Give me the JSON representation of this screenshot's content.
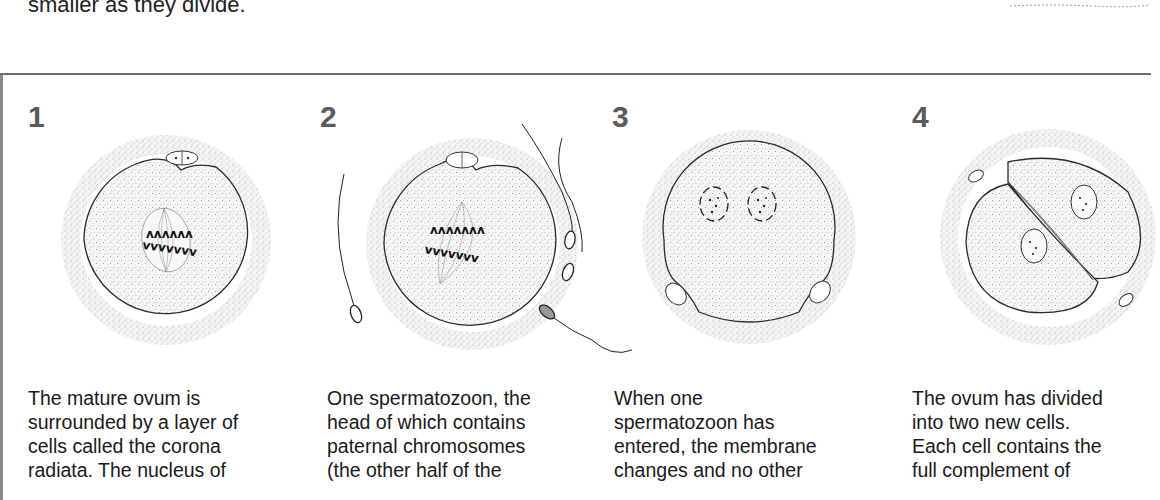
{
  "page": {
    "top_caption": "smaller as they divide.",
    "divider": true
  },
  "panels": [
    {
      "number": "1",
      "illustration": "mature-ovum-with-corona-radiata-and-spindle",
      "caption_lines": [
        "The mature ovum is",
        "surrounded by a layer of",
        "cells called the corona",
        "radiata. The nucleus of"
      ]
    },
    {
      "number": "2",
      "illustration": "spermatozoa-approaching-ovum",
      "caption_lines": [
        "One spermatozoon, the",
        "head of which contains",
        "paternal chromosomes",
        "(the other half of the"
      ]
    },
    {
      "number": "3",
      "illustration": "ovum-with-two-pronuclei",
      "caption_lines": [
        "When one",
        "spermatozoon has",
        "entered, the membrane",
        "changes and no other"
      ]
    },
    {
      "number": "4",
      "illustration": "ovum-divided-into-two-cells",
      "caption_lines": [
        "The ovum has divided",
        "into two new cells.",
        "Each cell contains the",
        "full complement of"
      ]
    }
  ],
  "colors": {
    "ink": "#1a1a1a",
    "step_number": "#5a5a5a",
    "stipple": "#9a9a9a",
    "rule": "#6d6d6d"
  }
}
